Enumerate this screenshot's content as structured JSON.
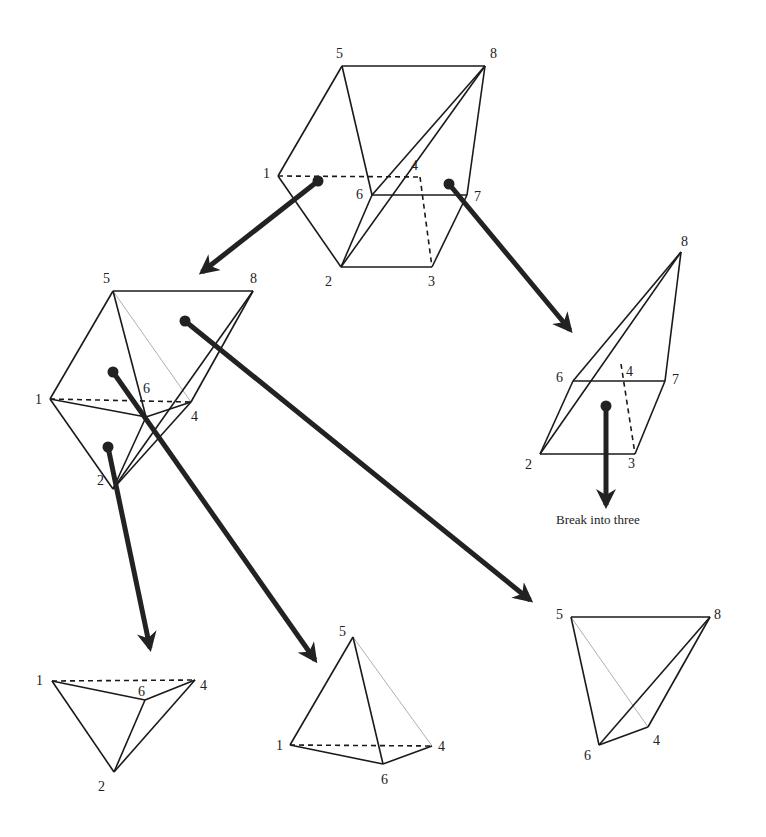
{
  "caption": "Break into three",
  "colors": {
    "stroke": "#1a1a1a",
    "arrow": "#222222",
    "thin": "#9a9a9a",
    "background": "#ffffff"
  },
  "shapes": [
    {
      "id": "hexahedron",
      "vertices": {
        "5": [
          342,
          66
        ],
        "8": [
          485,
          66
        ],
        "1": [
          278,
          176
        ],
        "4": [
          420,
          177
        ],
        "6": [
          372,
          195
        ],
        "7": [
          467,
          195
        ],
        "2": [
          341,
          267
        ],
        "3": [
          432,
          267
        ]
      },
      "labels": {
        "5": [
          336,
          58
        ],
        "8": [
          490,
          58
        ],
        "1": [
          263,
          178
        ],
        "4": [
          411,
          170
        ],
        "6": [
          356,
          199
        ],
        "7": [
          474,
          201
        ],
        "2": [
          325,
          286
        ],
        "3": [
          428,
          286
        ]
      },
      "edges": [
        [
          "5",
          "8"
        ],
        [
          "5",
          "1"
        ],
        [
          "5",
          "6"
        ],
        [
          "8",
          "6"
        ],
        [
          "8",
          "2"
        ],
        [
          "8",
          "7"
        ],
        [
          "1",
          "2"
        ],
        [
          "6",
          "7"
        ],
        [
          "6",
          "2"
        ],
        [
          "7",
          "3"
        ],
        [
          "2",
          "3"
        ]
      ],
      "dashed": [
        [
          "1",
          "4"
        ],
        [
          "4",
          "3"
        ]
      ],
      "thin": []
    },
    {
      "id": "left-wedge",
      "vertices": {
        "5": [
          113,
          291
        ],
        "8": [
          253,
          291
        ],
        "1": [
          50,
          399
        ],
        "6": [
          146,
          417
        ],
        "4": [
          191,
          402
        ],
        "2": [
          113,
          489
        ]
      },
      "labels": {
        "5": [
          103,
          283
        ],
        "8": [
          250,
          283
        ],
        "1": [
          35,
          404
        ],
        "6": [
          143,
          393
        ],
        "4": [
          191,
          421
        ],
        "2": [
          97,
          485
        ]
      },
      "edges": [
        [
          "5",
          "8"
        ],
        [
          "5",
          "1"
        ],
        [
          "5",
          "6"
        ],
        [
          "8",
          "2"
        ],
        [
          "8",
          "4"
        ],
        [
          "1",
          "6"
        ],
        [
          "1",
          "2"
        ],
        [
          "6",
          "4"
        ],
        [
          "6",
          "2"
        ],
        [
          "4",
          "2"
        ]
      ],
      "dashed": [
        [
          "1",
          "4"
        ]
      ],
      "thin": [
        [
          "5",
          "4"
        ]
      ]
    },
    {
      "id": "right-wedge",
      "vertices": {
        "8": [
          681,
          252
        ],
        "6": [
          573,
          381
        ],
        "7": [
          665,
          381
        ],
        "4": [
          621,
          364
        ],
        "2": [
          540,
          454
        ],
        "3": [
          635,
          454
        ]
      },
      "labels": {
        "8": [
          681,
          246
        ],
        "6": [
          556,
          382
        ],
        "7": [
          672,
          384
        ],
        "4": [
          626,
          376
        ],
        "2": [
          525,
          469
        ],
        "3": [
          628,
          468
        ]
      },
      "edges": [
        [
          "8",
          "6"
        ],
        [
          "8",
          "2"
        ],
        [
          "8",
          "7"
        ],
        [
          "6",
          "7"
        ],
        [
          "6",
          "2"
        ],
        [
          "7",
          "3"
        ],
        [
          "2",
          "3"
        ]
      ],
      "dashed": [
        [
          "4",
          "3"
        ]
      ],
      "thin": []
    },
    {
      "id": "tetra-1246",
      "vertices": {
        "1": [
          52,
          681
        ],
        "4": [
          195,
          680
        ],
        "6": [
          145,
          700
        ],
        "2": [
          114,
          772
        ]
      },
      "labels": {
        "1": [
          36,
          685
        ],
        "4": [
          200,
          690
        ],
        "6": [
          138,
          696
        ],
        "2": [
          98,
          791
        ]
      },
      "edges": [
        [
          "1",
          "6"
        ],
        [
          "1",
          "2"
        ],
        [
          "6",
          "4"
        ],
        [
          "6",
          "2"
        ],
        [
          "4",
          "2"
        ]
      ],
      "dashed": [
        [
          "1",
          "4"
        ]
      ],
      "thin": []
    },
    {
      "id": "tetra-1564",
      "vertices": {
        "5": [
          353,
          637
        ],
        "1": [
          290,
          745
        ],
        "4": [
          432,
          746
        ],
        "6": [
          383,
          764
        ]
      },
      "labels": {
        "5": [
          339,
          636
        ],
        "1": [
          276,
          750
        ],
        "4": [
          438,
          751
        ],
        "6": [
          381,
          784
        ]
      },
      "edges": [
        [
          "5",
          "1"
        ],
        [
          "5",
          "6"
        ],
        [
          "1",
          "6"
        ],
        [
          "6",
          "4"
        ]
      ],
      "dashed": [
        [
          "1",
          "4"
        ]
      ],
      "thin": [
        [
          "5",
          "4"
        ]
      ]
    },
    {
      "id": "tetra-5864",
      "vertices": {
        "5": [
          571,
          617
        ],
        "8": [
          710,
          617
        ],
        "6": [
          599,
          745
        ],
        "4": [
          648,
          727
        ]
      },
      "labels": {
        "5": [
          556,
          619
        ],
        "8": [
          714,
          619
        ],
        "6": [
          584,
          760
        ],
        "4": [
          653,
          745
        ]
      },
      "edges": [
        [
          "5",
          "8"
        ],
        [
          "5",
          "6"
        ],
        [
          "8",
          "6"
        ],
        [
          "8",
          "4"
        ],
        [
          "6",
          "4"
        ]
      ],
      "dashed": [],
      "thin": [
        [
          "5",
          "4"
        ]
      ]
    }
  ],
  "arrows": [
    {
      "id": "arrow-hex-to-left",
      "from": [
        318,
        181
      ],
      "to": [
        202,
        272
      ]
    },
    {
      "id": "arrow-hex-to-right",
      "from": [
        449,
        184
      ],
      "to": [
        570,
        330
      ]
    },
    {
      "id": "arrow-right-break",
      "from": [
        606,
        406
      ],
      "to": [
        606,
        505
      ]
    },
    {
      "id": "arrow-left-to-1246",
      "from": [
        108,
        447
      ],
      "to": [
        150,
        648
      ]
    },
    {
      "id": "arrow-left-to-1564",
      "from": [
        113,
        372
      ],
      "to": [
        315,
        660
      ]
    },
    {
      "id": "arrow-left-to-5864",
      "from": [
        185,
        321
      ],
      "to": [
        530,
        600
      ]
    }
  ],
  "caption_pos": [
    556,
    524
  ]
}
